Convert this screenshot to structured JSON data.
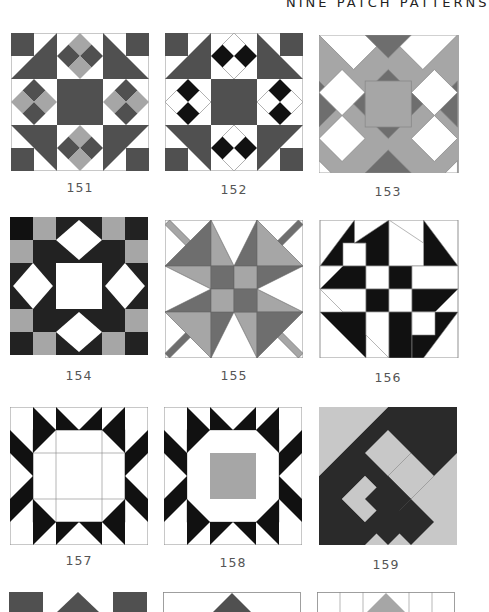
{
  "page": {
    "header": "NINE PATCH PATTERNS",
    "colors": {
      "dark": "#505050",
      "black": "#111111",
      "medium": "#a6a6a6",
      "light": "#c8c8c8",
      "white": "#ffffff",
      "line": "#888888"
    }
  },
  "blocks": [
    {
      "number": "151"
    },
    {
      "number": "152"
    },
    {
      "number": "153"
    },
    {
      "number": "154"
    },
    {
      "number": "155"
    },
    {
      "number": "156"
    },
    {
      "number": "157"
    },
    {
      "number": "158"
    },
    {
      "number": "159"
    },
    {
      "number": "160"
    },
    {
      "number": "161"
    },
    {
      "number": "162"
    }
  ]
}
